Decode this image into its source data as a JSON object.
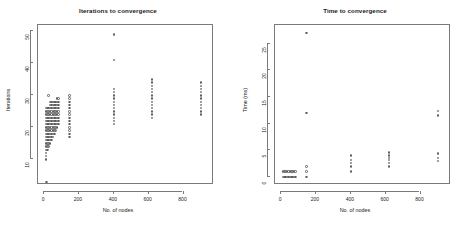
{
  "figure": {
    "background": "#ffffff",
    "point_color": "#5e5e5e",
    "axis_color": "#7a7a7a",
    "text_color": "#1a1a1a"
  },
  "chart_data": [
    {
      "type": "scatter",
      "title": "Iterations to convergence",
      "xlabel": "No. of nodes",
      "ylabel": "Iterations",
      "xlim": [
        -35,
        975
      ],
      "ylim": [
        2,
        52
      ],
      "xticks": [
        0,
        200,
        400,
        600,
        800
      ],
      "yticks": [
        10,
        20,
        30,
        40,
        50
      ],
      "grid": false,
      "legend": "none",
      "series": [
        {
          "name": "iterations",
          "points": [
            [
              10,
              10
            ],
            [
              10,
              11
            ],
            [
              10,
              12
            ],
            [
              10,
              13
            ],
            [
              10,
              14
            ],
            [
              10,
              15
            ],
            [
              10,
              16
            ],
            [
              10,
              17
            ],
            [
              10,
              18
            ],
            [
              10,
              19
            ],
            [
              10,
              20
            ],
            [
              10,
              21
            ],
            [
              10,
              22
            ],
            [
              10,
              23
            ],
            [
              10,
              24
            ],
            [
              10,
              25
            ],
            [
              10,
              26
            ],
            [
              14,
              3
            ],
            [
              18,
              13
            ],
            [
              18,
              14
            ],
            [
              18,
              15
            ],
            [
              18,
              16
            ],
            [
              18,
              17
            ],
            [
              18,
              18
            ],
            [
              18,
              19
            ],
            [
              18,
              20
            ],
            [
              18,
              21
            ],
            [
              18,
              22
            ],
            [
              18,
              23
            ],
            [
              18,
              24
            ],
            [
              18,
              25
            ],
            [
              18,
              26
            ],
            [
              26,
              14
            ],
            [
              26,
              15
            ],
            [
              26,
              16
            ],
            [
              26,
              17
            ],
            [
              26,
              18
            ],
            [
              26,
              19
            ],
            [
              26,
              20
            ],
            [
              26,
              21
            ],
            [
              26,
              22
            ],
            [
              26,
              23
            ],
            [
              26,
              24
            ],
            [
              26,
              25
            ],
            [
              26,
              26
            ],
            [
              26,
              30
            ],
            [
              34,
              15
            ],
            [
              34,
              16
            ],
            [
              34,
              17
            ],
            [
              34,
              18
            ],
            [
              34,
              19
            ],
            [
              34,
              20
            ],
            [
              34,
              21
            ],
            [
              34,
              22
            ],
            [
              34,
              23
            ],
            [
              34,
              24
            ],
            [
              34,
              25
            ],
            [
              34,
              26
            ],
            [
              34,
              27
            ],
            [
              34,
              28
            ],
            [
              42,
              16
            ],
            [
              42,
              17
            ],
            [
              42,
              18
            ],
            [
              42,
              19
            ],
            [
              42,
              20
            ],
            [
              42,
              21
            ],
            [
              42,
              22
            ],
            [
              42,
              23
            ],
            [
              42,
              24
            ],
            [
              42,
              25
            ],
            [
              42,
              26
            ],
            [
              42,
              27
            ],
            [
              42,
              28
            ],
            [
              50,
              17
            ],
            [
              50,
              18
            ],
            [
              50,
              19
            ],
            [
              50,
              20
            ],
            [
              50,
              21
            ],
            [
              50,
              22
            ],
            [
              50,
              23
            ],
            [
              50,
              24
            ],
            [
              50,
              25
            ],
            [
              50,
              26
            ],
            [
              50,
              27
            ],
            [
              50,
              28
            ],
            [
              58,
              18
            ],
            [
              58,
              19
            ],
            [
              58,
              20
            ],
            [
              58,
              21
            ],
            [
              58,
              22
            ],
            [
              58,
              23
            ],
            [
              58,
              24
            ],
            [
              58,
              25
            ],
            [
              58,
              26
            ],
            [
              58,
              27
            ],
            [
              58,
              28
            ],
            [
              66,
              19
            ],
            [
              66,
              20
            ],
            [
              66,
              21
            ],
            [
              66,
              22
            ],
            [
              66,
              23
            ],
            [
              66,
              24
            ],
            [
              66,
              25
            ],
            [
              66,
              26
            ],
            [
              66,
              27
            ],
            [
              66,
              28
            ],
            [
              74,
              20
            ],
            [
              74,
              21
            ],
            [
              74,
              22
            ],
            [
              74,
              23
            ],
            [
              74,
              24
            ],
            [
              74,
              25
            ],
            [
              74,
              26
            ],
            [
              74,
              27
            ],
            [
              74,
              28
            ],
            [
              74,
              29
            ],
            [
              82,
              21
            ],
            [
              82,
              22
            ],
            [
              82,
              23
            ],
            [
              82,
              24
            ],
            [
              82,
              25
            ],
            [
              82,
              26
            ],
            [
              82,
              27
            ],
            [
              82,
              28
            ],
            [
              82,
              29
            ],
            [
              145,
              17
            ],
            [
              145,
              18
            ],
            [
              145,
              19
            ],
            [
              145,
              20
            ],
            [
              145,
              21
            ],
            [
              145,
              22
            ],
            [
              145,
              23
            ],
            [
              145,
              24
            ],
            [
              145,
              25
            ],
            [
              145,
              26
            ],
            [
              145,
              27
            ],
            [
              145,
              28
            ],
            [
              145,
              29
            ],
            [
              145,
              30
            ],
            [
              400,
              21
            ],
            [
              400,
              22
            ],
            [
              400,
              23
            ],
            [
              400,
              24
            ],
            [
              400,
              25
            ],
            [
              400,
              26
            ],
            [
              400,
              27
            ],
            [
              400,
              28
            ],
            [
              400,
              29
            ],
            [
              400,
              30
            ],
            [
              400,
              31
            ],
            [
              400,
              32
            ],
            [
              400,
              41
            ],
            [
              400,
              49
            ],
            [
              620,
              23
            ],
            [
              620,
              24
            ],
            [
              620,
              25
            ],
            [
              620,
              26
            ],
            [
              620,
              27
            ],
            [
              620,
              28
            ],
            [
              620,
              29
            ],
            [
              620,
              30
            ],
            [
              620,
              31
            ],
            [
              620,
              32
            ],
            [
              620,
              33
            ],
            [
              620,
              34
            ],
            [
              620,
              35
            ],
            [
              900,
              24
            ],
            [
              900,
              25
            ],
            [
              900,
              26
            ],
            [
              900,
              27
            ],
            [
              900,
              28
            ],
            [
              900,
              29
            ],
            [
              900,
              30
            ],
            [
              900,
              31
            ],
            [
              900,
              32
            ],
            [
              900,
              33
            ],
            [
              900,
              34
            ]
          ]
        }
      ]
    },
    {
      "type": "scatter",
      "title": "Time to convergence",
      "xlabel": "No. of nodes",
      "ylabel": "Time (ms)",
      "xlim": [
        -35,
        975
      ],
      "ylim": [
        -1.5,
        28.5
      ],
      "xticks": [
        0,
        200,
        400,
        600,
        800
      ],
      "yticks": [
        0,
        5,
        10,
        15,
        20,
        25
      ],
      "grid": false,
      "legend": "none",
      "series": [
        {
          "name": "time_ms",
          "points": [
            [
              10,
              0
            ],
            [
              10,
              1
            ],
            [
              18,
              0
            ],
            [
              18,
              1
            ],
            [
              26,
              0
            ],
            [
              26,
              1
            ],
            [
              34,
              0
            ],
            [
              34,
              1
            ],
            [
              42,
              0
            ],
            [
              42,
              1
            ],
            [
              50,
              0
            ],
            [
              50,
              1
            ],
            [
              58,
              0
            ],
            [
              58,
              1
            ],
            [
              66,
              0
            ],
            [
              66,
              1
            ],
            [
              74,
              0
            ],
            [
              74,
              1
            ],
            [
              82,
              0
            ],
            [
              82,
              1
            ],
            [
              145,
              0
            ],
            [
              145,
              1
            ],
            [
              145,
              2
            ],
            [
              145,
              12
            ],
            [
              145,
              27
            ],
            [
              400,
              1
            ],
            [
              400,
              2
            ],
            [
              400,
              2.6
            ],
            [
              400,
              3.2
            ],
            [
              400,
              4
            ],
            [
              620,
              2
            ],
            [
              620,
              2.6
            ],
            [
              620,
              3.2
            ],
            [
              620,
              3.6
            ],
            [
              620,
              4
            ],
            [
              620,
              4.6
            ],
            [
              900,
              3
            ],
            [
              900,
              3.6
            ],
            [
              900,
              4.4
            ],
            [
              900,
              11.5
            ],
            [
              900,
              12.4
            ]
          ]
        }
      ]
    }
  ]
}
